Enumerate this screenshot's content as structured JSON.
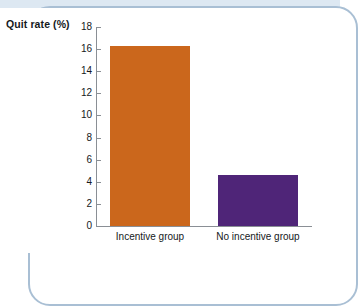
{
  "chart_data": {
    "type": "bar",
    "title": "",
    "subtitle": "",
    "xlabel": "",
    "ylabel": "Quit rate (%)",
    "categories": [
      "Incentive group",
      "No incentive group"
    ],
    "values": [
      16.3,
      4.6
    ],
    "series": [
      {
        "name": "Quit rate",
        "values": [
          16.3,
          4.6
        ],
        "colors": [
          "#cb671c",
          "#4f2578"
        ]
      }
    ],
    "ylim": [
      0,
      18
    ],
    "yticks": [
      0,
      2,
      4,
      6,
      8,
      10,
      12,
      14,
      16,
      18
    ],
    "ytick_labels": [
      "0",
      "2",
      "4",
      "6",
      "8",
      "10",
      "12",
      "14",
      "16",
      "18"
    ],
    "grid": false,
    "legend": "none",
    "bar_colors": {
      "incentive_group": "#cb671c",
      "no_incentive_group": "#4f2578"
    }
  },
  "frame": {
    "border_color": "#a9bfd4",
    "tint_color": "#dde8f2"
  }
}
